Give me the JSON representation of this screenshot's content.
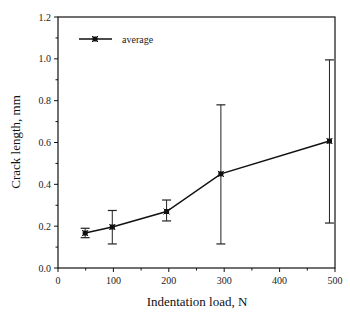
{
  "chart_data": {
    "type": "line",
    "title": "",
    "xlabel": "Indentation load, N",
    "ylabel": "Crack length, mm",
    "xlim": [
      0,
      500
    ],
    "ylim": [
      0.0,
      1.2
    ],
    "x_ticks": [
      "0",
      "100",
      "200",
      "300",
      "400",
      "500"
    ],
    "y_ticks": [
      "0.0",
      "0.2",
      "0.4",
      "0.6",
      "0.8",
      "1.0",
      "1.2"
    ],
    "grid": false,
    "legend_position": "upper left",
    "series": [
      {
        "name": "average",
        "marker": "x-square",
        "x": [
          49,
          98,
          196,
          294,
          490
        ],
        "values": [
          0.167,
          0.196,
          0.27,
          0.45,
          0.607
        ],
        "error_low": [
          0.145,
          0.115,
          0.225,
          0.115,
          0.215
        ],
        "error_high": [
          0.19,
          0.275,
          0.325,
          0.78,
          0.995
        ]
      }
    ]
  },
  "legend": {
    "label": "average"
  }
}
